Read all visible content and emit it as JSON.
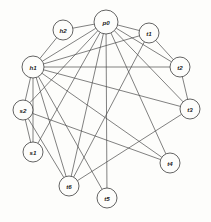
{
  "diagram": {
    "background_color": "#fdfdfb",
    "node_fill_color": "#fdfdfb",
    "node_stroke_color": "#3c3c3c",
    "edge_color": "#4a4a4a",
    "label_color": "#1a1a1a"
  },
  "nodes": [
    {
      "id": "p0",
      "label": "p0",
      "x": 106,
      "y": 22,
      "r": 12
    },
    {
      "id": "h2",
      "label": "h2",
      "x": 63,
      "y": 30,
      "r": 10
    },
    {
      "id": "t1",
      "label": "t1",
      "x": 149,
      "y": 33,
      "r": 10
    },
    {
      "id": "h1",
      "label": "h1",
      "x": 33,
      "y": 67,
      "r": 11
    },
    {
      "id": "t2",
      "label": "t2",
      "x": 180,
      "y": 67,
      "r": 10
    },
    {
      "id": "t3",
      "label": "t3",
      "x": 190,
      "y": 109,
      "r": 10
    },
    {
      "id": "s2",
      "label": "s2",
      "x": 23,
      "y": 110,
      "r": 10
    },
    {
      "id": "s1",
      "label": "s1",
      "x": 33,
      "y": 152,
      "r": 10
    },
    {
      "id": "t4",
      "label": "t4",
      "x": 170,
      "y": 163,
      "r": 10
    },
    {
      "id": "t6",
      "label": "t6",
      "x": 69,
      "y": 186,
      "r": 10
    },
    {
      "id": "t5",
      "label": "t5",
      "x": 107,
      "y": 198,
      "r": 10
    }
  ],
  "edges": [
    {
      "from": "p0",
      "to": "h2"
    },
    {
      "from": "p0",
      "to": "h1"
    },
    {
      "from": "p0",
      "to": "t1"
    },
    {
      "from": "p0",
      "to": "t2"
    },
    {
      "from": "p0",
      "to": "t3"
    },
    {
      "from": "p0",
      "to": "t4"
    },
    {
      "from": "p0",
      "to": "t5"
    },
    {
      "from": "p0",
      "to": "t6"
    },
    {
      "from": "p0",
      "to": "s1"
    },
    {
      "from": "p0",
      "to": "s2"
    },
    {
      "from": "h2",
      "to": "h1"
    },
    {
      "from": "h1",
      "to": "t1"
    },
    {
      "from": "h1",
      "to": "t2"
    },
    {
      "from": "h1",
      "to": "t3"
    },
    {
      "from": "h1",
      "to": "t4"
    },
    {
      "from": "h1",
      "to": "t5"
    },
    {
      "from": "h1",
      "to": "t6"
    },
    {
      "from": "h1",
      "to": "s2"
    },
    {
      "from": "h1",
      "to": "s1"
    },
    {
      "from": "s2",
      "to": "s1"
    },
    {
      "from": "s2",
      "to": "t4"
    },
    {
      "from": "s2",
      "to": "t6"
    },
    {
      "from": "t1",
      "to": "t2"
    },
    {
      "from": "t1",
      "to": "t6"
    },
    {
      "from": "t2",
      "to": "t3"
    },
    {
      "from": "t3",
      "to": "t6"
    }
  ],
  "edge_count_label": "26",
  "node_count_label": "11"
}
